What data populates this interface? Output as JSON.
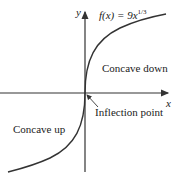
{
  "figure": {
    "function_label": "f(x) = 9x",
    "function_exponent": "1/3",
    "x_axis_label": "x",
    "y_axis_label": "y",
    "annotations": {
      "concave_down": "Concave down",
      "concave_up": "Concave up",
      "inflection": "Inflection point"
    },
    "colors": {
      "curve": "#333333",
      "axis": "#333333",
      "text": "#222222"
    }
  }
}
